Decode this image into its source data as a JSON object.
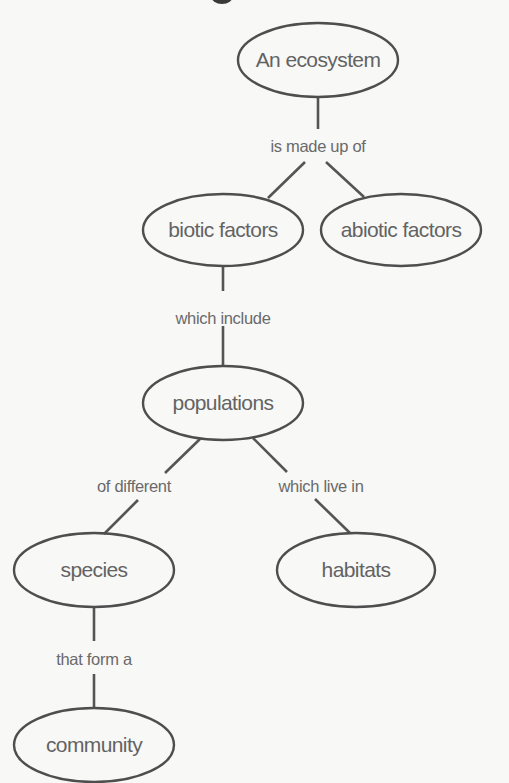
{
  "diagram": {
    "type": "concept-map",
    "colors": {
      "background": "#f8f8f7",
      "stroke": "#4e4e4e",
      "text": "#636363"
    },
    "nodes": [
      {
        "id": "ecosystem",
        "label": "An ecosystem",
        "cx": 318,
        "cy": 60,
        "rx": 80,
        "ry": 37
      },
      {
        "id": "biotic",
        "label": "biotic factors",
        "cx": 223,
        "cy": 230,
        "rx": 80,
        "ry": 36
      },
      {
        "id": "abiotic",
        "label": "abiotic factors",
        "cx": 401,
        "cy": 230,
        "rx": 80,
        "ry": 36
      },
      {
        "id": "populations",
        "label": "populations",
        "cx": 223,
        "cy": 403,
        "rx": 80,
        "ry": 37
      },
      {
        "id": "species",
        "label": "species",
        "cx": 94,
        "cy": 570,
        "rx": 80,
        "ry": 37
      },
      {
        "id": "habitats",
        "label": "habitats",
        "cx": 356,
        "cy": 570,
        "rx": 79,
        "ry": 37
      },
      {
        "id": "community",
        "label": "community",
        "cx": 94,
        "cy": 745,
        "rx": 80,
        "ry": 37
      }
    ],
    "links": [
      {
        "id": "made-up-of",
        "label": "is made up of",
        "from": "ecosystem",
        "to": [
          "biotic",
          "abiotic"
        ],
        "lx": 318,
        "ly": 152
      },
      {
        "id": "which-include",
        "label": "which include",
        "from": "biotic",
        "to": [
          "populations"
        ],
        "lx": 223,
        "ly": 324
      },
      {
        "id": "of-different",
        "label": "of different",
        "from": "populations",
        "to": [
          "species"
        ],
        "lx": 134,
        "ly": 492
      },
      {
        "id": "which-live-in",
        "label": "which live in",
        "from": "populations",
        "to": [
          "habitats"
        ],
        "lx": 321,
        "ly": 492
      },
      {
        "id": "that-form-a",
        "label": "that form a",
        "from": "species",
        "to": [
          "community"
        ],
        "lx": 94,
        "ly": 665
      }
    ]
  }
}
